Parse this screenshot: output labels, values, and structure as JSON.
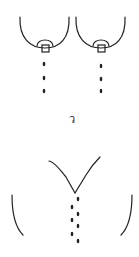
{
  "figure": {
    "label": "ว",
    "stroke_color": "#222222",
    "background": "#ffffff",
    "top_panel": {
      "description": "two breasts with nipples dripping milk",
      "drops_per_side": 3
    },
    "bottom_panel": {
      "description": "V-shaped torso with cluster of drops",
      "drop_count": 7
    }
  }
}
